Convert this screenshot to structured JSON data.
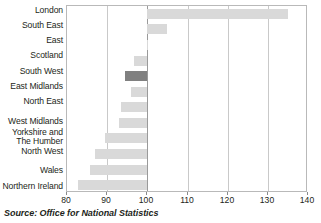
{
  "chart_data": {
    "type": "bar",
    "orientation": "horizontal",
    "title": "",
    "subtitle": "",
    "xlabel": "",
    "ylabel": "",
    "xlim": [
      80,
      140
    ],
    "baseline": 100,
    "grid": true,
    "gridlines": [
      80,
      90,
      100,
      110,
      120,
      130,
      140
    ],
    "legend": "none",
    "xticks": [
      "80",
      "90",
      "100",
      "110",
      "120",
      "130",
      "140"
    ],
    "categories": [
      "London",
      "South East",
      "East",
      "Scotland",
      "South West",
      "East Midlands",
      "North East",
      "West Midlands",
      "Yorkshire and\nThe Humber",
      "North West",
      "Wales",
      "Northern Ireland"
    ],
    "values": [
      135.0,
      105.0,
      100.0,
      96.7,
      94.5,
      96.0,
      93.5,
      93.0,
      89.5,
      87.0,
      85.7,
      82.7
    ],
    "highlight_category": "South West",
    "colors": {
      "bar": "#d9d9d9",
      "bar_highlight": "#808080",
      "gridline": "#c9c9c9",
      "baseline": "#9a9a9a",
      "plot_border": "#b9b9b9",
      "text": "#231f20"
    }
  },
  "source": {
    "note": "Source: Office for National Statistics"
  }
}
